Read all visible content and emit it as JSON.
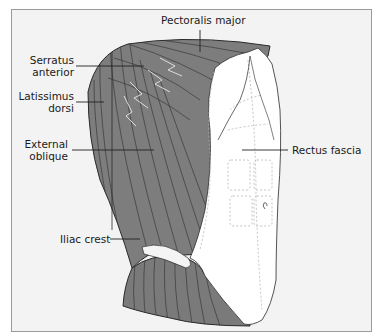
{
  "figure": {
    "type": "anatomical-illustration",
    "colors": {
      "background": "#f3f3f3",
      "frame": "#9a9a9a",
      "muscle": "#7d7d7d",
      "muscle_lines": "#3a3a3a",
      "fascia": "#ffffff",
      "fascia_hatch": "#b5b5b5",
      "leader_line": "#222222"
    }
  },
  "labels": {
    "pectoralis_major": "Pectoralis major",
    "serratus_anterior_line1": "Serratus",
    "serratus_anterior_line2": "anterior",
    "latissimus_dorsi_line1": "Latissimus",
    "latissimus_dorsi_line2": "dorsi",
    "external_oblique_line1": "External",
    "external_oblique_line2": "oblique",
    "rectus_fascia": "Rectus fascia",
    "iliac_crest": "Iliac crest"
  }
}
